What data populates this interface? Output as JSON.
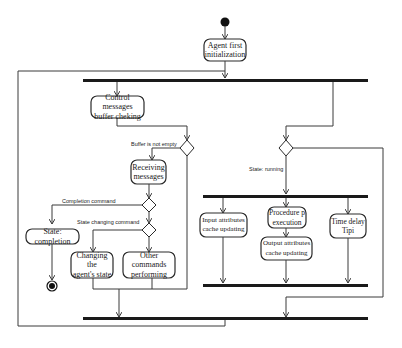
{
  "diagram": {
    "type": "UML activity diagram",
    "nodes": {
      "initial": {
        "kind": "initial-node"
      },
      "agent_init": {
        "label": "Agent first\ninitialization"
      },
      "control_buffer": {
        "label": "Control messages\nbuffer cheking"
      },
      "receiving": {
        "label": "Receiving\nmessages"
      },
      "state_completion": {
        "label": "State: completion"
      },
      "changing_state": {
        "label": "Changing the\nagent's state"
      },
      "other_commands": {
        "label": "Other commands\nperforming"
      },
      "input_attrs": {
        "label": "Input attributes\ncache updating"
      },
      "procedure_exec": {
        "label": "Procedure p\nexecution"
      },
      "output_attrs": {
        "label": "Output attributes\ncache updating"
      },
      "time_delay": {
        "label": "Time delay\nTipi"
      },
      "final": {
        "kind": "activity-final-node"
      }
    },
    "guards": {
      "buffer_not_empty": "Buffer is not empty",
      "completion_command": "Completion command",
      "state_changing_command": "State changing command",
      "state_running": "State: running"
    }
  }
}
